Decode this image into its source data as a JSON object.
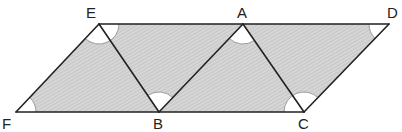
{
  "diagram": {
    "type": "geometry",
    "colors": {
      "fill": "#d4d4d4",
      "hatch": "#bdbdbd",
      "stroke": "#222222",
      "arc_fill": "#ffffff",
      "arc_stroke": "#888888",
      "label": "#222222"
    },
    "vertices": [
      {
        "id": "E",
        "label": "E",
        "x": 99,
        "y": 24,
        "label_x": 86,
        "label_y": 18
      },
      {
        "id": "A",
        "label": "A",
        "x": 243,
        "y": 24,
        "label_x": 237,
        "label_y": 18
      },
      {
        "id": "D",
        "label": "D",
        "x": 389,
        "y": 24,
        "label_x": 387,
        "label_y": 18
      },
      {
        "id": "F",
        "label": "F",
        "x": 16,
        "y": 112,
        "label_x": 2,
        "label_y": 129
      },
      {
        "id": "B",
        "label": "B",
        "x": 159,
        "y": 112,
        "label_x": 153,
        "label_y": 129
      },
      {
        "id": "C",
        "label": "C",
        "x": 304,
        "y": 112,
        "label_x": 298,
        "label_y": 129
      }
    ],
    "outline": [
      "F",
      "C",
      "D",
      "E"
    ],
    "segments": [
      [
        "E",
        "B"
      ],
      [
        "B",
        "A"
      ],
      [
        "A",
        "C"
      ]
    ],
    "angle_marks": [
      {
        "at": "F",
        "radius": 20
      },
      {
        "at": "E",
        "radius": 20
      },
      {
        "at": "B",
        "radius": 20
      },
      {
        "at": "A",
        "radius": 20
      },
      {
        "at": "C",
        "radius": 20
      },
      {
        "at": "D",
        "radius": 20
      }
    ]
  }
}
